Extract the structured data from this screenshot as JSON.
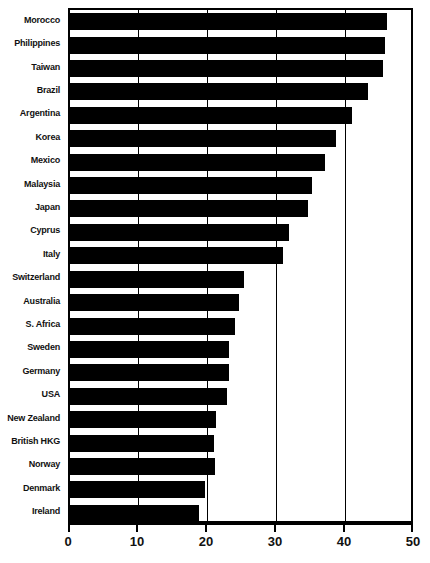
{
  "chart_data": {
    "type": "bar",
    "orientation": "horizontal",
    "title": "",
    "subtitle": "",
    "xlabel": "",
    "ylabel": "",
    "xlim": [
      0,
      50
    ],
    "xticks": [
      0,
      10,
      20,
      30,
      40,
      50
    ],
    "xtick_labels": [
      "0",
      "10",
      "20",
      "30",
      "40",
      "50"
    ],
    "grid": true,
    "grid_axis": "x",
    "legend": false,
    "legend_position": "none",
    "bar_color": "#000000",
    "background_color": "#ffffff",
    "axis_color": "#000000",
    "categories": [
      "Morocco",
      "Philippines",
      "Taiwan",
      "Brazil",
      "Argentina",
      "Korea",
      "Mexico",
      "Malaysia",
      "Japan",
      "Cyprus",
      "Italy",
      "Switzerland",
      "Australia",
      "S. Africa",
      "Sweden",
      "Germany",
      "USA",
      "New Zealand",
      "British HKG",
      "Norway",
      "Denmark",
      "Ireland"
    ],
    "values": [
      46.0,
      45.6,
      45.4,
      43.2,
      40.8,
      38.6,
      36.9,
      35.0,
      34.5,
      31.8,
      30.9,
      25.2,
      24.5,
      23.9,
      23.1,
      23.0,
      22.7,
      21.2,
      20.8,
      21.0,
      19.5,
      18.7
    ]
  }
}
